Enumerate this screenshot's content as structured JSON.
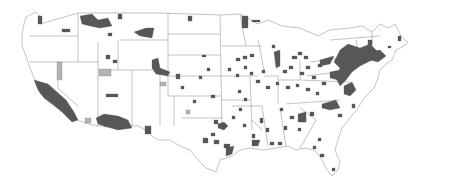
{
  "map": {
    "type": "choropleth",
    "region": "United States (contiguous)",
    "granularity": "county",
    "legend": [],
    "colors": {
      "background": "#ffffff",
      "state_border": "#9a9a9a",
      "category_dark": "#575757",
      "category_light": "#b4b4b4",
      "unshaded": "#ffffff"
    },
    "categories": [
      {
        "name": "dark",
        "color": "#575757"
      },
      {
        "name": "light",
        "color": "#b4b4b4"
      }
    ]
  }
}
